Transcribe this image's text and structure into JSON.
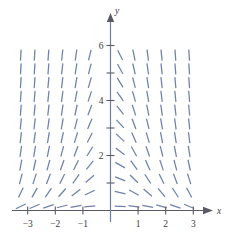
{
  "chart_data": {
    "type": "scatter",
    "subtype": "slope-field",
    "title": "",
    "subtitle": "",
    "xlabel": "x",
    "ylabel": "y",
    "xlim": [
      -3.6,
      3.6
    ],
    "ylim": [
      -0.35,
      7.0
    ],
    "grid": false,
    "legend": null,
    "equation": "dy/dx = -x*y",
    "x_ticks": [
      -3,
      -2,
      -1,
      1,
      2,
      3
    ],
    "x_tick_labels": [
      "−3",
      "−2",
      "−1",
      "1",
      "2",
      "3"
    ],
    "y_ticks": [
      1,
      2,
      3,
      4,
      5,
      6
    ],
    "y_tick_labels": [
      "",
      "2",
      "",
      "4",
      "",
      "6"
    ],
    "y_labeled_ticks": [
      2,
      4,
      6
    ],
    "sample_x": [
      -3.25,
      -2.75,
      -2.25,
      -1.75,
      -1.25,
      -0.75,
      0.35,
      0.85,
      1.35,
      1.85,
      2.35,
      2.85
    ],
    "sample_y": [
      0.15,
      0.65,
      1.15,
      1.65,
      2.15,
      2.65,
      3.15,
      3.65,
      4.15,
      4.65,
      5.15,
      5.65
    ],
    "n_cols": 12,
    "n_rows": 12,
    "segment_length_px": 11,
    "colors": {
      "segment": "#6c81ab",
      "axis": "#5a5a66",
      "yaxis": "#6a7fa8",
      "label": "#3a3a44",
      "background": "#ffffff"
    }
  },
  "axes": {
    "x_label": "x",
    "y_label": "y"
  },
  "x_tick_text": {
    "t0": "−3",
    "t1": "−2",
    "t2": "−1",
    "t3": "1",
    "t4": "2",
    "t5": "3"
  },
  "y_tick_text": {
    "t2": "2",
    "t4": "4",
    "t6": "6"
  }
}
